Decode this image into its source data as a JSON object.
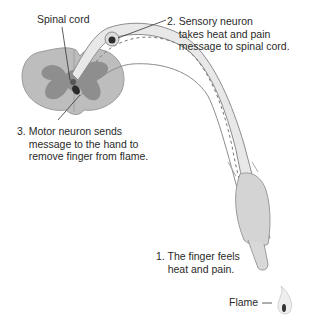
{
  "labels": {
    "spinal_cord": "Spinal cord",
    "sensory": "2. Sensory neuron\n    takes heat and pain\n    message to spinal cord.",
    "motor": "3. Motor neuron sends\n    message to the hand to\n    remove finger from flame.",
    "finger": "1. The finger feels\n    heat and pain.",
    "flame": "Flame"
  },
  "colors": {
    "cord_outer": "#b9b9b9",
    "cord_inner": "#8a8a8a",
    "nerve_fill": "#e6e6e6",
    "nerve_stroke": "#8c8c8c",
    "finger_fill": "#d2d2d2",
    "neuron_body": "#2b2b2b"
  }
}
